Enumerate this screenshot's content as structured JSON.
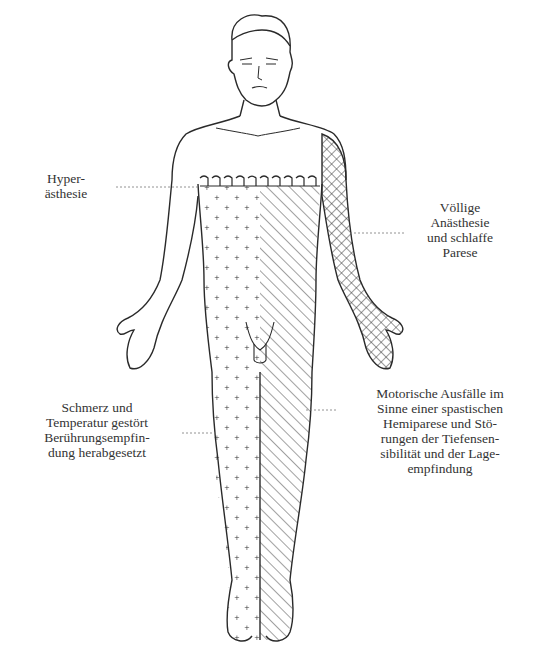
{
  "figure": {
    "regions": [
      {
        "id": "hyperaesthesia_band",
        "pattern": "loop-band",
        "location": "chest band at nipple level"
      },
      {
        "id": "left_side_sensory",
        "pattern": "crosses (+)",
        "location": "viewer-left half of trunk and leg"
      },
      {
        "id": "right_side_motor",
        "pattern": "diagonal hatching",
        "location": "viewer-right half of trunk and leg"
      },
      {
        "id": "right_arm_anaesthesia",
        "pattern": "cross-hatching",
        "location": "viewer-right arm and hand"
      }
    ]
  },
  "labels": {
    "hyper": [
      "Hyper-",
      "ästhesie"
    ],
    "voellig": [
      "Völlige",
      "Anästhesie",
      "und schlaffe",
      "Parese"
    ],
    "schmerz": [
      "Schmerz und",
      "Temperatur gestört",
      "Berührungsempfin-",
      "dung herabgesetzt"
    ],
    "motor": [
      "Motorische Ausfälle im",
      "Sinne einer spastischen",
      "Hemiparese und Stö-",
      "rungen der Tiefensen-",
      "sibilität und der Lage-",
      "empfindung"
    ]
  },
  "colors": {
    "ink": "#2a2a2a",
    "background": "#ffffff"
  }
}
